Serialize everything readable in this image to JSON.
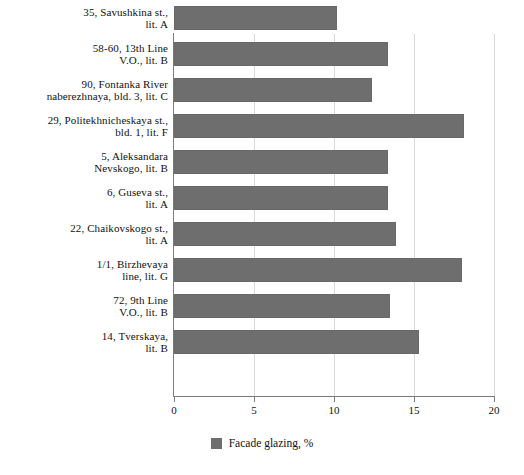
{
  "chart_data": {
    "type": "bar",
    "orientation": "horizontal",
    "title": "",
    "xlabel": "",
    "ylabel": "",
    "xlim": [
      0,
      20
    ],
    "xticks": [
      "0",
      "5",
      "10",
      "15",
      "20"
    ],
    "grid": true,
    "legend_position": "bottom",
    "series_name": "Facade glazing, %",
    "series_color": "#6e6e6e",
    "categories": [
      "35, Savushkina st., lit. A",
      "58-60, 13th Line V.O., lit. B",
      "90, Fontanka River naberezhnaya, bld. 3, lit. C",
      "29, Politekhnicheskaya st., bld. 1, lit. F",
      "5, Aleksandara Nevskogo, lit. B",
      "6, Guseva st., lit. A",
      "22, Chaikovskogo st., lit. A",
      "1/1, Birzhevaya line, lit. G",
      "72, 9th Line V.O., lit. B",
      "14, Tverskaya, lit. B"
    ],
    "values": [
      10.2,
      13.4,
      12.4,
      18.1,
      13.4,
      13.4,
      13.9,
      18.0,
      13.5,
      15.3
    ]
  },
  "categories_lines": [
    [
      "35, Savushkina st.,",
      "lit. A"
    ],
    [
      "58-60, 13th Line",
      "V.O., lit. B"
    ],
    [
      "90, Fontanka River",
      "naberezhnaya, bld. 3, lit. C"
    ],
    [
      "29, Politekhnicheskaya st.,",
      "bld. 1, lit. F"
    ],
    [
      "5, Aleksandara",
      "Nevskogo, lit. B"
    ],
    [
      "6, Guseva st.,",
      "lit. A"
    ],
    [
      "22, Chaikovskogo st.,",
      "lit. A"
    ],
    [
      "1/1, Birzhevaya",
      "line, lit. G"
    ],
    [
      "72, 9th Line",
      "V.O., lit. B"
    ],
    [
      "14, Tverskaya,",
      "lit. B"
    ]
  ],
  "legend": {
    "label": "Facade glazing, %"
  }
}
